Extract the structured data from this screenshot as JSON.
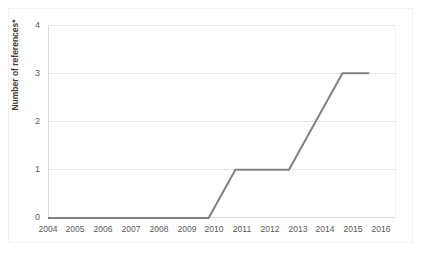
{
  "chart_data": {
    "type": "line",
    "title": "",
    "subtitle": "",
    "xlabel": "",
    "ylabel": "Number of references*",
    "x": [
      2004,
      2005,
      2006,
      2007,
      2008,
      2009,
      2010,
      2011,
      2012,
      2013,
      2014,
      2015,
      2016
    ],
    "categories": [
      "2004",
      "2005",
      "2006",
      "2007",
      "2008",
      "2009",
      "2010",
      "2011",
      "2012",
      "2013",
      "2014",
      "2015",
      "2016"
    ],
    "values": [
      0,
      0,
      0,
      0,
      0,
      0,
      0,
      1,
      1,
      1,
      2,
      3,
      3
    ],
    "series": [
      {
        "name": "Number of references",
        "values": [
          0,
          0,
          0,
          0,
          0,
          0,
          0,
          1,
          1,
          1,
          2,
          3,
          3
        ],
        "color": "#808080"
      }
    ],
    "ylim": [
      0,
      4
    ],
    "yticks": [
      0,
      1,
      2,
      3,
      4
    ],
    "ytick_labels": [
      "0",
      "1",
      "2",
      "3",
      "4"
    ],
    "xlim": [
      2004,
      2016
    ],
    "grid": true,
    "grid_axis": "y",
    "legend": false,
    "legend_position": "none",
    "line_width": 2,
    "markers": false
  },
  "style": {
    "line_color": "#808080",
    "grid_color": "#e8e8e8",
    "axis_color": "#d9d9d9",
    "tick_label_color": "#595959",
    "axis_title_color": "#404040",
    "background": "#ffffff",
    "frame_color": "#f2f2f2"
  }
}
